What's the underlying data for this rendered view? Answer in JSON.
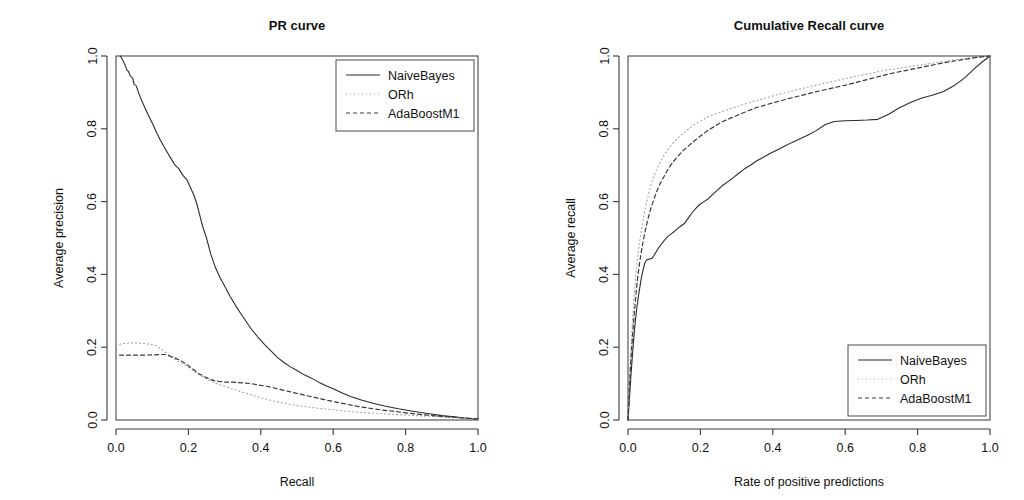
{
  "figure": {
    "background": "#ffffff",
    "axis_color": "#3a3a3a"
  },
  "series_styles": {
    "NaiveBayes": {
      "color": "#2b2b2b",
      "dash": "none",
      "width": 1.1
    },
    "ORh": {
      "color": "#9f9f9f",
      "dash": "1,3",
      "width": 1.1
    },
    "AdaBoostM1": {
      "color": "#3a3a3a",
      "dash": "4,3",
      "width": 1.2
    }
  },
  "chart_data": [
    {
      "id": "pr-curve",
      "type": "line",
      "title": "PR curve",
      "xlabel": "Recall",
      "ylabel": "Average precision",
      "xlim": [
        0,
        1
      ],
      "ylim": [
        0,
        1
      ],
      "xticks": [
        0.0,
        0.2,
        0.4,
        0.6,
        0.8,
        1.0
      ],
      "yticks": [
        0.0,
        0.2,
        0.4,
        0.6,
        0.8,
        1.0
      ],
      "xticklabels": [
        "0.0",
        "0.2",
        "0.4",
        "0.6",
        "0.8",
        "1.0"
      ],
      "yticklabels": [
        "0.0",
        "0.2",
        "0.4",
        "0.6",
        "0.8",
        "1.0"
      ],
      "grid": false,
      "legend": {
        "position": "top-right",
        "entries": [
          "NaiveBayes",
          "ORh",
          "AdaBoostM1"
        ]
      },
      "series": [
        {
          "name": "NaiveBayes",
          "x": [
            0.012,
            0.018,
            0.025,
            0.03,
            0.034,
            0.04,
            0.046,
            0.05,
            0.056,
            0.062,
            0.07,
            0.078,
            0.086,
            0.094,
            0.102,
            0.112,
            0.122,
            0.132,
            0.142,
            0.152,
            0.163,
            0.174,
            0.185,
            0.196,
            0.205,
            0.215,
            0.224,
            0.232,
            0.24,
            0.25,
            0.262,
            0.275,
            0.288,
            0.3,
            0.315,
            0.33,
            0.345,
            0.36,
            0.375,
            0.392,
            0.41,
            0.428,
            0.446,
            0.464,
            0.482,
            0.5,
            0.52,
            0.54,
            0.56,
            0.58,
            0.6,
            0.625,
            0.65,
            0.68,
            0.71,
            0.745,
            0.78,
            0.82,
            0.86,
            0.9,
            0.94,
            0.97,
            1.0
          ],
          "y": [
            1.0,
            0.99,
            0.975,
            0.962,
            0.958,
            0.944,
            0.94,
            0.922,
            0.918,
            0.9,
            0.88,
            0.862,
            0.845,
            0.828,
            0.812,
            0.79,
            0.77,
            0.752,
            0.735,
            0.718,
            0.7,
            0.69,
            0.672,
            0.66,
            0.64,
            0.618,
            0.592,
            0.56,
            0.53,
            0.5,
            0.455,
            0.418,
            0.39,
            0.368,
            0.34,
            0.315,
            0.292,
            0.27,
            0.248,
            0.228,
            0.208,
            0.19,
            0.172,
            0.158,
            0.146,
            0.136,
            0.124,
            0.115,
            0.104,
            0.094,
            0.086,
            0.074,
            0.064,
            0.054,
            0.046,
            0.038,
            0.031,
            0.024,
            0.018,
            0.012,
            0.008,
            0.005,
            0.003
          ]
        },
        {
          "name": "ORh",
          "x": [
            0.01,
            0.02,
            0.032,
            0.044,
            0.056,
            0.068,
            0.08,
            0.092,
            0.104,
            0.112,
            0.122,
            0.134,
            0.146,
            0.158,
            0.17,
            0.184,
            0.198,
            0.212,
            0.226,
            0.24,
            0.256,
            0.272,
            0.29,
            0.308,
            0.326,
            0.344,
            0.364,
            0.384,
            0.404,
            0.424,
            0.444,
            0.466,
            0.488,
            0.512,
            0.536,
            0.56,
            0.59,
            0.62,
            0.65,
            0.69,
            0.73,
            0.77,
            0.81,
            0.85,
            0.89,
            0.93,
            0.965,
            1.0
          ],
          "y": [
            0.208,
            0.21,
            0.211,
            0.212,
            0.212,
            0.211,
            0.21,
            0.208,
            0.206,
            0.204,
            0.196,
            0.188,
            0.178,
            0.17,
            0.162,
            0.154,
            0.146,
            0.136,
            0.126,
            0.118,
            0.11,
            0.102,
            0.096,
            0.09,
            0.084,
            0.078,
            0.072,
            0.066,
            0.06,
            0.055,
            0.05,
            0.046,
            0.042,
            0.038,
            0.035,
            0.032,
            0.029,
            0.026,
            0.023,
            0.02,
            0.018,
            0.015,
            0.013,
            0.011,
            0.009,
            0.007,
            0.005,
            0.003
          ]
        },
        {
          "name": "AdaBoostM1",
          "x": [
            0.01,
            0.024,
            0.038,
            0.052,
            0.066,
            0.08,
            0.094,
            0.108,
            0.12,
            0.134,
            0.148,
            0.164,
            0.18,
            0.196,
            0.212,
            0.228,
            0.246,
            0.264,
            0.284,
            0.304,
            0.326,
            0.348,
            0.372,
            0.396,
            0.42,
            0.444,
            0.47,
            0.496,
            0.522,
            0.548,
            0.576,
            0.604,
            0.634,
            0.664,
            0.696,
            0.73,
            0.766,
            0.804,
            0.844,
            0.886,
            0.93,
            0.966,
            1.0
          ],
          "y": [
            0.178,
            0.178,
            0.178,
            0.178,
            0.178,
            0.178,
            0.179,
            0.179,
            0.18,
            0.18,
            0.176,
            0.17,
            0.162,
            0.152,
            0.14,
            0.128,
            0.118,
            0.11,
            0.106,
            0.104,
            0.104,
            0.102,
            0.1,
            0.096,
            0.092,
            0.086,
            0.08,
            0.074,
            0.068,
            0.062,
            0.056,
            0.05,
            0.044,
            0.038,
            0.033,
            0.028,
            0.024,
            0.019,
            0.015,
            0.011,
            0.008,
            0.005,
            0.003
          ]
        }
      ]
    },
    {
      "id": "cumulative-recall-curve",
      "type": "line",
      "title": "Cumulative Recall curve",
      "xlabel": "Rate of positive predictions",
      "ylabel": "Average recall",
      "xlim": [
        0,
        1
      ],
      "ylim": [
        0,
        1
      ],
      "xticks": [
        0.0,
        0.2,
        0.4,
        0.6,
        0.8,
        1.0
      ],
      "yticks": [
        0.0,
        0.2,
        0.4,
        0.6,
        0.8,
        1.0
      ],
      "xticklabels": [
        "0.0",
        "0.2",
        "0.4",
        "0.6",
        "0.8",
        "1.0"
      ],
      "yticklabels": [
        "0.0",
        "0.2",
        "0.4",
        "0.6",
        "0.8",
        "1.0"
      ],
      "grid": false,
      "legend": {
        "position": "bottom-right",
        "entries": [
          "NaiveBayes",
          "ORh",
          "AdaBoostM1"
        ]
      },
      "series": [
        {
          "name": "NaiveBayes",
          "x": [
            0.0,
            0.004,
            0.008,
            0.012,
            0.016,
            0.02,
            0.024,
            0.028,
            0.032,
            0.036,
            0.04,
            0.046,
            0.052,
            0.058,
            0.062,
            0.066,
            0.072,
            0.078,
            0.084,
            0.09,
            0.096,
            0.104,
            0.112,
            0.12,
            0.128,
            0.136,
            0.146,
            0.156,
            0.166,
            0.176,
            0.186,
            0.198,
            0.21,
            0.222,
            0.234,
            0.248,
            0.262,
            0.276,
            0.29,
            0.306,
            0.322,
            0.338,
            0.356,
            0.374,
            0.392,
            0.412,
            0.432,
            0.452,
            0.474,
            0.496,
            0.52,
            0.545,
            0.57,
            0.6,
            0.63,
            0.66,
            0.69,
            0.72,
            0.75,
            0.78,
            0.81,
            0.84,
            0.87,
            0.9,
            0.93,
            0.96,
            0.98,
            1.0
          ],
          "y": [
            0.0,
            0.06,
            0.12,
            0.175,
            0.225,
            0.27,
            0.305,
            0.335,
            0.36,
            0.385,
            0.405,
            0.43,
            0.44,
            0.442,
            0.443,
            0.444,
            0.452,
            0.462,
            0.472,
            0.48,
            0.488,
            0.498,
            0.506,
            0.512,
            0.518,
            0.525,
            0.533,
            0.54,
            0.554,
            0.568,
            0.58,
            0.592,
            0.6,
            0.608,
            0.62,
            0.632,
            0.645,
            0.655,
            0.665,
            0.678,
            0.69,
            0.7,
            0.712,
            0.722,
            0.732,
            0.742,
            0.752,
            0.762,
            0.772,
            0.782,
            0.795,
            0.812,
            0.82,
            0.822,
            0.823,
            0.824,
            0.826,
            0.84,
            0.858,
            0.872,
            0.884,
            0.892,
            0.902,
            0.918,
            0.94,
            0.968,
            0.985,
            1.0
          ]
        },
        {
          "name": "ORh",
          "x": [
            0.0,
            0.003,
            0.006,
            0.009,
            0.012,
            0.015,
            0.018,
            0.022,
            0.026,
            0.03,
            0.034,
            0.04,
            0.046,
            0.052,
            0.058,
            0.064,
            0.072,
            0.08,
            0.09,
            0.1,
            0.112,
            0.124,
            0.138,
            0.152,
            0.168,
            0.184,
            0.202,
            0.22,
            0.24,
            0.262,
            0.285,
            0.31,
            0.336,
            0.364,
            0.392,
            0.422,
            0.454,
            0.486,
            0.52,
            0.556,
            0.592,
            0.63,
            0.668,
            0.706,
            0.746,
            0.786,
            0.826,
            0.866,
            0.906,
            0.946,
            0.975,
            1.0
          ],
          "y": [
            0.0,
            0.075,
            0.145,
            0.21,
            0.265,
            0.315,
            0.36,
            0.405,
            0.442,
            0.475,
            0.502,
            0.54,
            0.572,
            0.6,
            0.625,
            0.648,
            0.672,
            0.69,
            0.71,
            0.728,
            0.745,
            0.76,
            0.775,
            0.788,
            0.8,
            0.812,
            0.822,
            0.832,
            0.84,
            0.848,
            0.856,
            0.864,
            0.872,
            0.88,
            0.888,
            0.896,
            0.904,
            0.912,
            0.92,
            0.928,
            0.936,
            0.944,
            0.952,
            0.96,
            0.966,
            0.972,
            0.978,
            0.984,
            0.99,
            0.995,
            0.998,
            1.0
          ]
        },
        {
          "name": "AdaBoostM1",
          "x": [
            0.0,
            0.003,
            0.006,
            0.01,
            0.014,
            0.018,
            0.022,
            0.026,
            0.031,
            0.036,
            0.042,
            0.048,
            0.055,
            0.062,
            0.07,
            0.078,
            0.088,
            0.098,
            0.11,
            0.122,
            0.136,
            0.15,
            0.166,
            0.182,
            0.2,
            0.218,
            0.238,
            0.258,
            0.28,
            0.304,
            0.328,
            0.354,
            0.382,
            0.41,
            0.44,
            0.472,
            0.504,
            0.538,
            0.574,
            0.61,
            0.648,
            0.686,
            0.726,
            0.766,
            0.806,
            0.846,
            0.886,
            0.926,
            0.962,
            1.0
          ],
          "y": [
            0.0,
            0.068,
            0.132,
            0.195,
            0.25,
            0.3,
            0.345,
            0.385,
            0.425,
            0.458,
            0.492,
            0.522,
            0.552,
            0.578,
            0.602,
            0.625,
            0.648,
            0.666,
            0.688,
            0.706,
            0.722,
            0.738,
            0.752,
            0.766,
            0.78,
            0.794,
            0.806,
            0.818,
            0.828,
            0.838,
            0.848,
            0.858,
            0.866,
            0.874,
            0.882,
            0.89,
            0.898,
            0.906,
            0.914,
            0.922,
            0.932,
            0.942,
            0.952,
            0.96,
            0.968,
            0.976,
            0.984,
            0.99,
            0.996,
            1.0
          ]
        }
      ]
    }
  ]
}
